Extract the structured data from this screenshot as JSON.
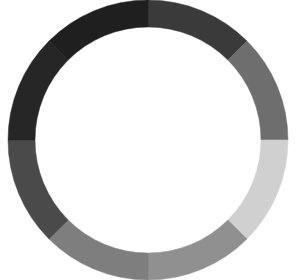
{
  "figure": {
    "background_color": "#ffffff",
    "width": 296,
    "height": 280
  },
  "chart_data": {
    "type": "pie",
    "variant": "donut",
    "title": "",
    "subtitle": "",
    "xlabel": "",
    "ylabel": "",
    "legend": {
      "visible": false,
      "position": "none"
    },
    "grid": false,
    "labels_visible": false,
    "center": {
      "x": 148,
      "y": 140
    },
    "outer_radius": 140,
    "inner_radius": 113,
    "hole_ratio": 0.807,
    "start_angle_deg": -90,
    "direction": "clockwise",
    "total": 100,
    "categories": [
      "Segment 1",
      "Segment 2",
      "Segment 3",
      "Segment 4",
      "Segment 5",
      "Segment 6",
      "Segment 7",
      "Segment 8"
    ],
    "values": [
      12.5,
      12.5,
      12.5,
      12.5,
      12.5,
      12.5,
      12.5,
      12.5
    ],
    "angles_deg": [
      45,
      45,
      45,
      45,
      45,
      45,
      45,
      45
    ],
    "colors": [
      "#3a3a3a",
      "#6e6e6e",
      "#d0d0d0",
      "#909090",
      "#7e7e7e",
      "#4a4a4a",
      "#262626",
      "#1f1f1f"
    ],
    "segments": [
      {
        "label": "Segment 1",
        "value": 12.5,
        "color": "#3a3a3a",
        "start_deg": -90,
        "end_deg": -45
      },
      {
        "label": "Segment 2",
        "value": 12.5,
        "color": "#6e6e6e",
        "start_deg": -45,
        "end_deg": 0
      },
      {
        "label": "Segment 3",
        "value": 12.5,
        "color": "#d0d0d0",
        "start_deg": 0,
        "end_deg": 45
      },
      {
        "label": "Segment 4",
        "value": 12.5,
        "color": "#909090",
        "start_deg": 45,
        "end_deg": 90
      },
      {
        "label": "Segment 5",
        "value": 12.5,
        "color": "#7e7e7e",
        "start_deg": 90,
        "end_deg": 135
      },
      {
        "label": "Segment 6",
        "value": 12.5,
        "color": "#4a4a4a",
        "start_deg": 135,
        "end_deg": 180
      },
      {
        "label": "Segment 7",
        "value": 12.5,
        "color": "#262626",
        "start_deg": 180,
        "end_deg": 225
      },
      {
        "label": "Segment 8",
        "value": 12.5,
        "color": "#1f1f1f",
        "start_deg": 225,
        "end_deg": 270
      }
    ]
  }
}
